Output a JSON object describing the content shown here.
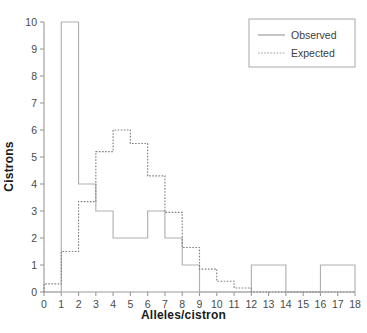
{
  "chart_data": {
    "type": "line",
    "title": "",
    "subtitle": "",
    "xlabel": "Alleles/cistron",
    "ylabel": "Cistrons",
    "xlim": [
      0,
      18
    ],
    "ylim": [
      0,
      10
    ],
    "xticks": [
      "0",
      "1",
      "2",
      "3",
      "4",
      "5",
      "6",
      "7",
      "8",
      "9",
      "10",
      "11",
      "12",
      "13",
      "14",
      "15",
      "16",
      "17",
      "18"
    ],
    "yticks": [
      "0",
      "1",
      "2",
      "3",
      "4",
      "5",
      "6",
      "7",
      "8",
      "9",
      "10"
    ],
    "grid": false,
    "legend_position": "top-right",
    "bin_edges": [
      0,
      1,
      2,
      3,
      4,
      5,
      6,
      7,
      8,
      9,
      10,
      11,
      12,
      13,
      14,
      15,
      16,
      17,
      18
    ],
    "series": [
      {
        "name": "Observed",
        "style": "solid",
        "color": "#b0b0b0",
        "values": [
          0,
          10,
          4,
          3,
          2,
          2,
          3,
          2,
          1,
          0,
          0,
          0,
          1,
          1,
          0,
          0,
          1,
          1
        ]
      },
      {
        "name": "Expected",
        "style": "dotted",
        "color": "#808080",
        "values": [
          0.3,
          1.5,
          3.35,
          5.2,
          6.0,
          5.5,
          4.3,
          2.95,
          1.65,
          0.85,
          0.4,
          0.15,
          0,
          0,
          0,
          0,
          0,
          0
        ]
      }
    ],
    "legend": [
      {
        "label": "Observed",
        "style": "solid"
      },
      {
        "label": "Expected",
        "style": "dotted"
      }
    ]
  }
}
